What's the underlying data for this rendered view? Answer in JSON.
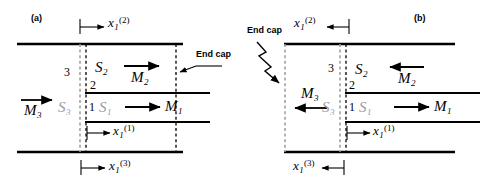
{
  "figure": {
    "type": "technical-diagram",
    "panels": [
      {
        "tag": "(a)",
        "annotations": {
          "end_cap": "End cap",
          "region_3": "3",
          "region_2": "2",
          "region_1": "1",
          "area_2": "S",
          "area_2_sub": "2",
          "area_3": "S",
          "area_3_sub": "3",
          "area_1": "S",
          "area_1_sub": "1",
          "mass_flow_1": "M",
          "mass_flow_1_sub": "1",
          "mass_flow_2": "M",
          "mass_flow_2_sub": "2",
          "mass_flow_3": "M",
          "mass_flow_3_sub": "3",
          "dim_x1": "x",
          "dim_x1_sub": "1",
          "dim_x1_sup": "(1)",
          "dim_x2": "x",
          "dim_x2_sub": "1",
          "dim_x2_sup": "(2)",
          "dim_x3": "x",
          "dim_x3_sub": "1",
          "dim_x3_sup": "(3)"
        },
        "arrow_directions": {
          "mass_flow_1": "right",
          "mass_flow_2": "right",
          "mass_flow_3": "right",
          "dim_x1": "right",
          "dim_x2": "right",
          "dim_x3": "right",
          "end_cap_pointer": "left"
        }
      },
      {
        "tag": "(b)",
        "annotations": {
          "end_cap": "End cap",
          "region_3": "3",
          "region_2": "2",
          "region_1": "1",
          "area_2": "S",
          "area_2_sub": "2",
          "area_3": "S",
          "area_3_sub": "3",
          "area_1": "S",
          "area_1_sub": "1",
          "mass_flow_1": "M",
          "mass_flow_1_sub": "1",
          "mass_flow_2": "M",
          "mass_flow_2_sub": "2",
          "mass_flow_3": "M",
          "mass_flow_3_sub": "3",
          "dim_x1": "x",
          "dim_x1_sub": "1",
          "dim_x1_sup": "(1)",
          "dim_x2": "x",
          "dim_x2_sub": "1",
          "dim_x2_sup": "(2)",
          "dim_x3": "x",
          "dim_x3_sub": "1",
          "dim_x3_sup": "(3)"
        },
        "arrow_directions": {
          "mass_flow_1": "right",
          "mass_flow_2": "left",
          "mass_flow_3": "left",
          "dim_x1": "right",
          "dim_x2": "left",
          "dim_x3": "left",
          "end_cap_pointer": "down-right-zigzag"
        }
      }
    ],
    "colors": {
      "line": "#000000",
      "faint_line": "#9a9a9a",
      "background": "#ffffff"
    }
  }
}
